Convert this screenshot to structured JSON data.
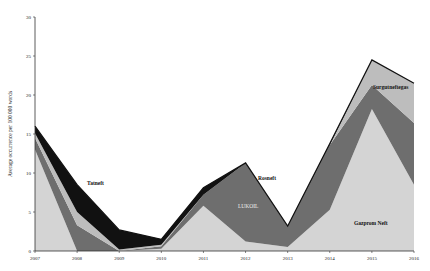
{
  "chart_data": {
    "type": "area",
    "stacked": true,
    "title": "",
    "xlabel": "",
    "ylabel": "Average occurrence per 100 000 words",
    "ylim": [
      0,
      30
    ],
    "yticks": [
      0,
      5,
      10,
      15,
      20,
      25,
      30
    ],
    "x": [
      "2007",
      "2008",
      "2009",
      "2010",
      "2011",
      "2012",
      "2013",
      "2014",
      "2015",
      "2016"
    ],
    "grid": false,
    "legend": "inline labels",
    "series": [
      {
        "name": "Gazprom Neft",
        "color": "#d4d4d4",
        "values": [
          13.0,
          0.0,
          0.0,
          0.3,
          5.8,
          1.2,
          0.5,
          5.3,
          18.2,
          8.5
        ]
      },
      {
        "name": "LUKOIL",
        "color": "#6e6e6e",
        "values": [
          1.5,
          3.3,
          0.0,
          0.3,
          1.4,
          10.1,
          2.6,
          8.3,
          3.1,
          7.9
        ]
      },
      {
        "name": "Surgutneftegas",
        "color": "#bdbdbd",
        "values": [
          0.6,
          1.7,
          0.2,
          0.2,
          0.0,
          0.0,
          0.0,
          0.0,
          3.2,
          5.1
        ]
      },
      {
        "name": "Tatneft",
        "color": "#111111",
        "values": [
          0.9,
          3.5,
          2.5,
          0.7,
          0.9,
          0.0,
          0.1,
          0.2,
          0.0,
          0.0
        ]
      },
      {
        "name": "Rosneft",
        "color": "#2a2a2a",
        "values": [
          0.0,
          0.0,
          0.0,
          0.0,
          0.0,
          0.0,
          0.0,
          0.0,
          0.0,
          0.0
        ]
      }
    ],
    "totals": [
      16.0,
      8.5,
      2.7,
      1.5,
      8.1,
      11.3,
      3.2,
      13.8,
      24.5,
      21.5
    ],
    "annotations": [
      {
        "text": "Tatneft",
        "x": "2008",
        "y": 8.5
      },
      {
        "text": "Rosneft",
        "x": "2012",
        "y": 9.5
      },
      {
        "text": "LUKOIL",
        "x": "2012",
        "y": 5.6
      },
      {
        "text": "Surgutneftegas",
        "x": "2016",
        "y": 20.9
      },
      {
        "text": "Gazprom Neft",
        "x": "2015",
        "y": 3.5
      }
    ]
  }
}
